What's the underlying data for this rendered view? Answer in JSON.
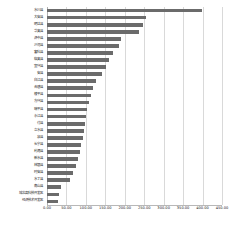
{
  "chart_data": {
    "type": "bar",
    "orientation": "horizontal",
    "title": "",
    "subtitle": "",
    "xlabel": "",
    "ylabel": "",
    "xlim": [
      0,
      450
    ],
    "ylim": null,
    "grid": true,
    "grid_axis": "x",
    "legend": false,
    "legend_position": "none",
    "bar_color": "#6b6b6b",
    "gridline_color": "#d9d9d9",
    "background_color": "#ffffff",
    "text_color": "#202020",
    "xticks": [
      0,
      50,
      100,
      150,
      200,
      250,
      300,
      350,
      400,
      450
    ],
    "xticklabels": [
      "0.00",
      "50.00",
      "100.00",
      "150.00",
      "200.00",
      "250.00",
      "300.00",
      "350.00",
      "400.00",
      "450.00"
    ],
    "categories": [
      "水川县",
      "大安县",
      "明达县",
      "华奥县",
      "济中县",
      "沙河县",
      "富科县",
      "临奥县",
      "宜兴县",
      "安县",
      "白江县",
      "合碧县",
      "棱平县",
      "方兴县",
      "瑞平县",
      "永江县",
      "付县",
      "立水县",
      "泉县",
      "长宁县",
      "利港县",
      "新水县",
      "林银县",
      "时安县",
      "水丁县",
      "南山县",
      "城北高科技开发区",
      "经济技术开发区"
    ],
    "values": [
      398.0,
      255.0,
      246.0,
      237.0,
      189.0,
      185.0,
      170.0,
      160.0,
      152.0,
      142.0,
      125.0,
      118.0,
      112.0,
      108.0,
      104.0,
      101.0,
      98.0,
      95.0,
      92.0,
      88.0,
      84.0,
      80.0,
      75.0,
      68.0,
      60.0,
      36.0,
      31.0,
      29.0
    ]
  }
}
